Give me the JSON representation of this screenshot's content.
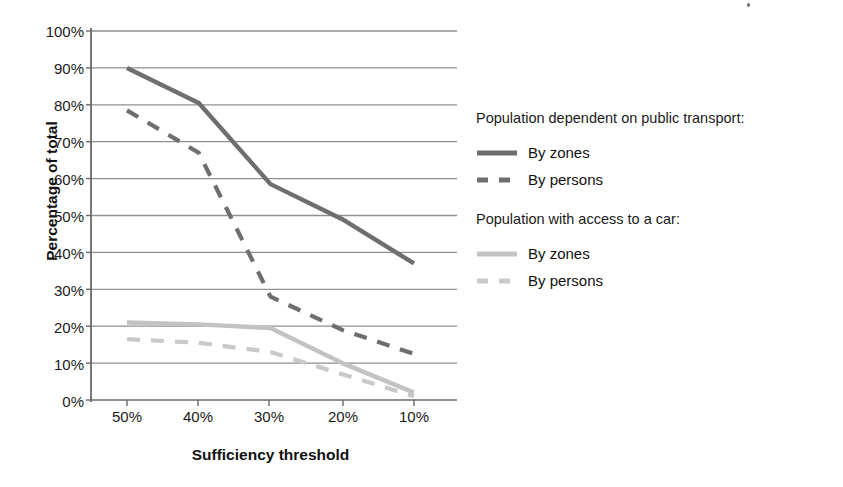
{
  "axes": {
    "y_title": "Percentage of total",
    "x_title": "Sufficiency threshold",
    "y_ticks": [
      "100%",
      "90%",
      "80%",
      "70%",
      "60%",
      "50%",
      "40%",
      "30%",
      "20%",
      "10%",
      "0%"
    ],
    "x_ticks": [
      "50%",
      "40%",
      "30%",
      "20%",
      "10%"
    ]
  },
  "legend": {
    "group1": {
      "heading": "Population dependent on public transport:",
      "items": [
        {
          "label": "By zones",
          "style": "solid",
          "color": "#6e6e6e"
        },
        {
          "label": "By persons",
          "style": "dashed",
          "color": "#6e6e6e"
        }
      ]
    },
    "group2": {
      "heading": "Population with access to a car:",
      "items": [
        {
          "label": "By zones",
          "style": "solid",
          "color": "#c3c3c3"
        },
        {
          "label": "By persons",
          "style": "dashed",
          "color": "#c9c9c9"
        }
      ]
    }
  },
  "colors": {
    "dark_line": "#6e6e6e",
    "light_line": "#c3c3c3",
    "gridline": "#8f8f8f",
    "axis": "#6a6a6a",
    "text": "#111111"
  },
  "chart_data": {
    "type": "line",
    "title": "",
    "xlabel": "Sufficiency threshold",
    "ylabel": "Percentage of total",
    "x": [
      50,
      40,
      30,
      20,
      10
    ],
    "x_tick_labels": [
      "50%",
      "40%",
      "30%",
      "20%",
      "10%"
    ],
    "xlim": [
      50,
      10
    ],
    "ylim": [
      0,
      100
    ],
    "y_tick_labels": [
      "0%",
      "10%",
      "20%",
      "30%",
      "40%",
      "50%",
      "60%",
      "70%",
      "80%",
      "90%",
      "100%"
    ],
    "grid": true,
    "legend_position": "right",
    "series": [
      {
        "name": "Population dependent on public transport — By zones",
        "group": "Population dependent on public transport:",
        "label": "By zones",
        "style": "solid",
        "color": "#6e6e6e",
        "values": [
          90,
          80.5,
          58.5,
          49,
          37
        ]
      },
      {
        "name": "Population dependent on public transport — By persons",
        "group": "Population dependent on public transport:",
        "label": "By persons",
        "style": "dashed",
        "color": "#6e6e6e",
        "values": [
          78.5,
          67,
          28,
          19,
          12.5
        ]
      },
      {
        "name": "Population with access to a car — By zones",
        "group": "Population with access to a car:",
        "label": "By zones",
        "style": "solid",
        "color": "#c3c3c3",
        "values": [
          21,
          20.5,
          19.5,
          10,
          2
        ]
      },
      {
        "name": "Population with access to a car — By persons",
        "group": "Population with access to a car:",
        "label": "By persons",
        "style": "dashed",
        "color": "#c9c9c9",
        "values": [
          16.5,
          15.5,
          13,
          7,
          1
        ]
      }
    ]
  }
}
